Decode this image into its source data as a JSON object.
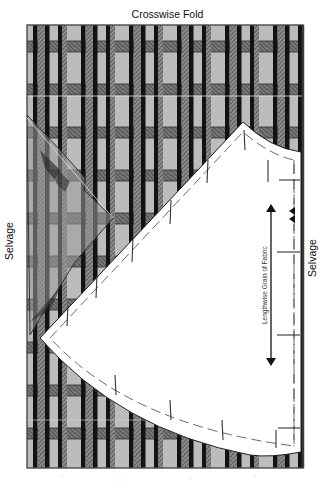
{
  "diagram": {
    "title": "Crosswise Fold",
    "labels": {
      "selvage_left": "Selvage",
      "selvage_right": "Selvage",
      "grain": "Lengthwise Grain of Fabric"
    },
    "fabric": {
      "type": "plaid",
      "rect": {
        "x": 27,
        "y": 25,
        "width": 276,
        "height": 443
      },
      "background_color": "#b9b9b9",
      "stripe_color": "#141414",
      "band_color": "#6e6e6e",
      "vertical_repeat_px": 48,
      "horizontal_band_ys": [
        42,
        85,
        128,
        171,
        214,
        257,
        300,
        343,
        386,
        429
      ]
    },
    "pattern_piece": {
      "shape": "quarter-circle skirt section",
      "fill": "#ffffff",
      "apex": [
        40,
        338
      ],
      "top_corner": [
        243,
        122
      ],
      "right_edge_x": 301,
      "bottom_corner": [
        301,
        452
      ],
      "notches": "double triangle at right fold line"
    },
    "ghost_piece": {
      "tip": [
        113,
        218
      ],
      "fill": "#8a8a8a"
    },
    "grain_arrow": {
      "x": 268,
      "y1": 204,
      "y2": 366
    }
  }
}
